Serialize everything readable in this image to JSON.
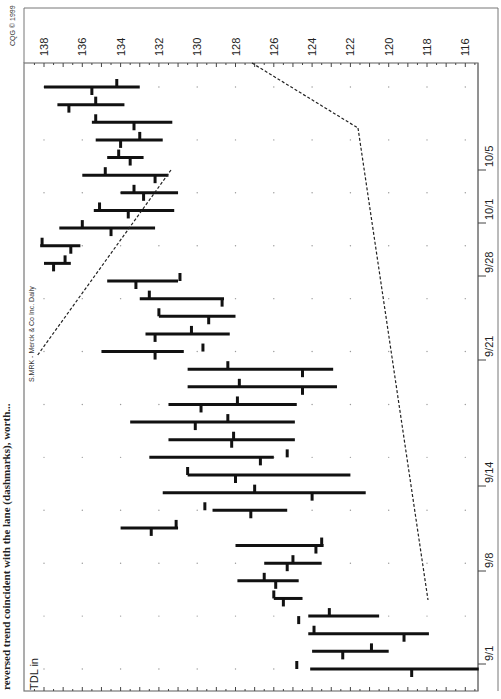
{
  "caption_fragment": "reversed trend coincident with the lane (dashmarks), worth...",
  "copyright": "CQG © 1999",
  "indicator_label": "TDL in",
  "colors": {
    "bars": "#111111",
    "frame": "#777777",
    "grid": "#999999",
    "background": "#ffffff"
  },
  "chart_data": {
    "type": "ohlc",
    "title": "S.MRK - Merck & Co Inc. Daily",
    "orientation": "rotated 90° clockwise (price on horizontal axis, decreasing left to right; dates run bottom to top)",
    "xlabel": "Date",
    "ylabel": "Price",
    "ylim": [
      115.3,
      139.0
    ],
    "price_ticks": [
      138,
      136,
      134,
      132,
      130,
      128,
      126,
      124,
      122,
      120,
      118,
      116
    ],
    "date_ticks": [
      "9/1",
      "9/8",
      "9/14",
      "9/21",
      "9/28",
      "10/1",
      "10/5"
    ],
    "grid": "dotted",
    "bars": [
      {
        "high": 138.0,
        "low": 133.0,
        "open": 134.2,
        "close": 135.5
      },
      {
        "high": 137.3,
        "low": 133.8,
        "open": 135.3,
        "close": 136.7
      },
      {
        "high": 135.5,
        "low": 131.3,
        "open": 135.3,
        "close": 133.3
      },
      {
        "high": 135.3,
        "low": 131.8,
        "open": 133.0,
        "close": 134.0
      },
      {
        "high": 134.7,
        "low": 132.8,
        "open": 134.1,
        "close": 133.5
      },
      {
        "high": 136.0,
        "low": 131.5,
        "open": 134.8,
        "close": 132.2
      },
      {
        "high": 134.0,
        "low": 131.0,
        "open": 133.3,
        "close": 132.8
      },
      {
        "high": 135.4,
        "low": 131.2,
        "open": 135.1,
        "close": 133.6
      },
      {
        "high": 137.2,
        "low": 132.2,
        "open": 136.0,
        "close": 134.5
      },
      {
        "high": 138.2,
        "low": 136.1,
        "open": 138.1,
        "close": 136.6
      },
      {
        "high": 138.0,
        "low": 136.6,
        "open": 136.9,
        "close": 137.5
      },
      {
        "high": 134.7,
        "low": 131.0,
        "open": 130.9,
        "close": 133.2
      },
      {
        "high": 133.0,
        "low": 128.6,
        "open": 132.5,
        "close": 128.7
      },
      {
        "high": 132.0,
        "low": 128.0,
        "open": 132.0,
        "close": 129.4
      },
      {
        "high": 132.7,
        "low": 128.3,
        "open": 130.3,
        "close": 132.2
      },
      {
        "high": 135.0,
        "low": 130.7,
        "open": 129.7,
        "close": 132.2
      },
      {
        "high": 130.5,
        "low": 122.9,
        "open": 128.4,
        "close": 124.5
      },
      {
        "high": 130.5,
        "low": 122.7,
        "open": 127.8,
        "close": 124.5
      },
      {
        "high": 131.5,
        "low": 124.8,
        "open": 127.9,
        "close": 129.8
      },
      {
        "high": 133.5,
        "low": 124.9,
        "open": 128.4,
        "close": 130.1
      },
      {
        "high": 131.5,
        "low": 124.9,
        "open": 128.1,
        "close": 128.2
      },
      {
        "high": 132.5,
        "low": 126.0,
        "open": 125.3,
        "close": 126.7
      },
      {
        "high": 130.5,
        "low": 122.0,
        "open": 130.5,
        "close": 128.0
      },
      {
        "high": 131.8,
        "low": 121.2,
        "open": 127.0,
        "close": 124.0
      },
      {
        "high": 129.2,
        "low": 125.3,
        "open": 129.6,
        "close": 127.2
      },
      {
        "high": 134.0,
        "low": 131.0,
        "open": 131.1,
        "close": 132.4
      },
      {
        "high": 128.0,
        "low": 123.4,
        "open": 123.5,
        "close": 123.8
      },
      {
        "high": 126.5,
        "low": 123.5,
        "open": 125.0,
        "close": 125.3
      },
      {
        "high": 127.9,
        "low": 124.7,
        "open": 126.5,
        "close": 125.9
      },
      {
        "high": 126.0,
        "low": 124.5,
        "open": 126.0,
        "close": 125.5
      },
      {
        "high": 124.2,
        "low": 120.5,
        "open": 123.1,
        "close": 124.7
      },
      {
        "high": 124.2,
        "low": 117.9,
        "open": 123.9,
        "close": 119.2
      },
      {
        "high": 124.0,
        "low": 120.0,
        "open": 120.9,
        "close": 122.4
      },
      {
        "high": 124.1,
        "low": 115.3,
        "open": 124.8,
        "close": 118.8
      }
    ],
    "trendlines": [
      {
        "name": "upper-left dashed",
        "from": {
          "bar": 10,
          "price": 137.8
        },
        "to": {
          "bar": 0,
          "price": 127.3
        }
      },
      {
        "name": "apex dashed",
        "from": {
          "bar": 0,
          "price": 127.3
        },
        "to": {
          "bar": 2,
          "price": 121.3
        }
      },
      {
        "name": "right dashed",
        "from": {
          "bar": 2,
          "price": 122.3
        },
        "to": {
          "bar": 31,
          "price": 118.0
        }
      }
    ]
  }
}
